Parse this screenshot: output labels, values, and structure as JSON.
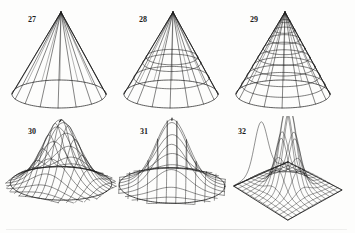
{
  "figure": {
    "background_color": "#fdfdfc",
    "line_color": "#1c1c1c",
    "label_color": "#1a1a1a",
    "panel_count": 6,
    "columns": 3,
    "rows": 2
  },
  "panels": [
    {
      "id": "panel-27",
      "label": "27",
      "label_x": 26,
      "label_y": 14,
      "origin_x": 2,
      "origin_y": 2,
      "kind": "cone",
      "description": "Cone wireframe with meridian lines only and a single base ellipse",
      "apex_x": 59,
      "apex_y": 10,
      "base_cx": 57,
      "base_cy": 92,
      "base_rx": 47,
      "base_ry": 14,
      "meridians": 16,
      "parallels": 0,
      "show_base_ellipse": true
    },
    {
      "id": "panel-28",
      "label": "28",
      "label_x": 25,
      "label_y": 14,
      "origin_x": 114,
      "origin_y": 2,
      "kind": "cone",
      "description": "Cone wireframe with meridians plus three horizontal parallels",
      "apex_x": 59,
      "apex_y": 10,
      "base_cx": 57,
      "base_cy": 92,
      "base_rx": 47,
      "base_ry": 14,
      "meridians": 16,
      "parallels": 3,
      "parallel_levels": [
        0.55,
        0.62,
        0.8
      ],
      "show_base_ellipse": true
    },
    {
      "id": "panel-29",
      "label": "29",
      "label_x": 24,
      "label_y": 14,
      "origin_x": 226,
      "origin_y": 2,
      "kind": "cone",
      "description": "Dense cone mesh: meridians plus eight evenly spaced parallels",
      "apex_x": 59,
      "apex_y": 10,
      "base_cx": 57,
      "base_cy": 92,
      "base_rx": 47,
      "base_ry": 14,
      "meridians": 16,
      "parallels": 8,
      "show_base_ellipse": true
    },
    {
      "id": "panel-30",
      "label": "30",
      "label_x": 26,
      "label_y": 12,
      "origin_x": 2,
      "origin_y": 116,
      "kind": "surface",
      "description": "Smooth bell/tent surface with rotated diamond mesh",
      "peak_height": 62,
      "center_x": 59,
      "center_y": 72,
      "half_width": 48,
      "half_depth": 16,
      "mesh_u": 14,
      "mesh_v": 14,
      "mesh_rotation_deg": 45,
      "sharpness": 2.1,
      "skirt": 0.24
    },
    {
      "id": "panel-31",
      "label": "31",
      "label_x": 26,
      "label_y": 12,
      "origin_x": 114,
      "origin_y": 116,
      "kind": "surface",
      "description": "Tent surface with coarser rectangular diagonal mesh, tilted view",
      "peak_height": 66,
      "center_x": 58,
      "center_y": 72,
      "half_width": 50,
      "half_depth": 17,
      "mesh_u": 11,
      "mesh_v": 11,
      "mesh_rotation_deg": 20,
      "sharpness": 2.4,
      "skirt": 0.2
    },
    {
      "id": "panel-32",
      "label": "32",
      "label_x": 12,
      "label_y": 12,
      "origin_x": 226,
      "origin_y": 116,
      "kind": "surface-on-plane",
      "description": "Spike surface standing on a rectangular ground plane drawn as a parallelogram, with a profile outline curve at the left",
      "peak_height": 80,
      "center_x": 58,
      "center_y": 68,
      "half_width": 42,
      "half_depth": 22,
      "mesh_u": 13,
      "mesh_v": 13,
      "sharpness": 3.0,
      "plane_corners": [
        [
          8,
          70
        ],
        [
          62,
          46
        ],
        [
          116,
          74
        ],
        [
          62,
          104
        ]
      ],
      "show_profile_curve": true
    }
  ]
}
